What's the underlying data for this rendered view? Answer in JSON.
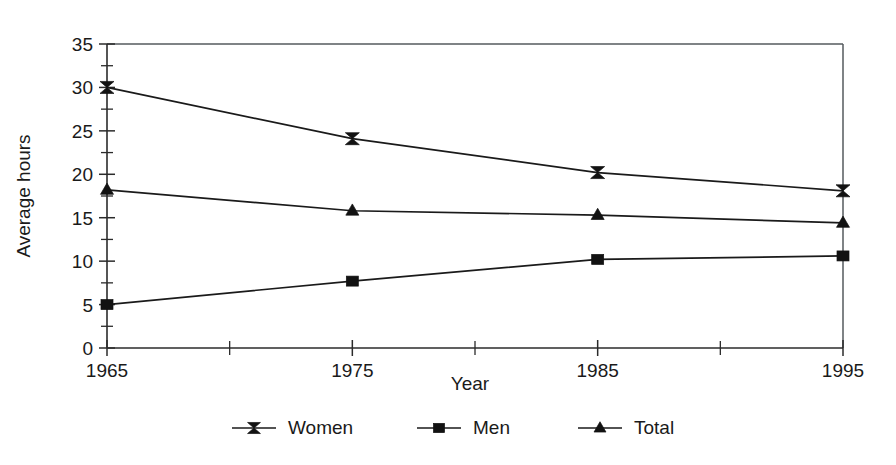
{
  "chart_data": {
    "type": "line",
    "title": "",
    "xlabel": "Year",
    "ylabel": "Average hours",
    "x": [
      1965,
      1975,
      1985,
      1995
    ],
    "xtick_labels": [
      "1965",
      "1975",
      "1985",
      "1995"
    ],
    "xlim": [
      1965,
      1995
    ],
    "x_minor_ticks": [
      1970,
      1980,
      1990
    ],
    "ytick_labels": [
      "0",
      "5",
      "10",
      "15",
      "20",
      "25",
      "30",
      "35"
    ],
    "yticks": [
      0,
      5,
      10,
      15,
      20,
      25,
      30,
      35
    ],
    "y_minor_ticks": [
      2.5,
      7.5,
      12.5,
      17.5,
      22.5,
      27.5,
      32.5
    ],
    "ylim": [
      0,
      35
    ],
    "grid": false,
    "legend_position": "bottom",
    "series": [
      {
        "name": "Women",
        "marker": "bowtie",
        "values": [
          30.0,
          24.1,
          20.2,
          18.1
        ]
      },
      {
        "name": "Men",
        "marker": "square",
        "values": [
          5.0,
          7.7,
          10.2,
          10.6
        ]
      },
      {
        "name": "Total",
        "marker": "triangle",
        "values": [
          18.2,
          15.8,
          15.3,
          14.4
        ]
      }
    ],
    "colors": {
      "line": "#1a1a1a",
      "marker": "#121212",
      "axis": "#2b2b2b",
      "frame": "#555a5e",
      "background": "#ffffff"
    }
  }
}
